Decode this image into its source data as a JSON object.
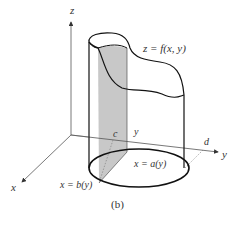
{
  "figure": {
    "caption": "(b)",
    "axes": {
      "x_label": "x",
      "y_label": "y",
      "z_label": "z"
    },
    "labels": {
      "surface": "z = f(x, y)",
      "left_boundary": "x = b(y)",
      "right_boundary": "x = a(y)",
      "y_lower": "c",
      "y_upper": "d",
      "y_slice": "y"
    },
    "colors": {
      "line": "#111111",
      "axis": "#555555",
      "shading": "#c8c8c8"
    }
  }
}
